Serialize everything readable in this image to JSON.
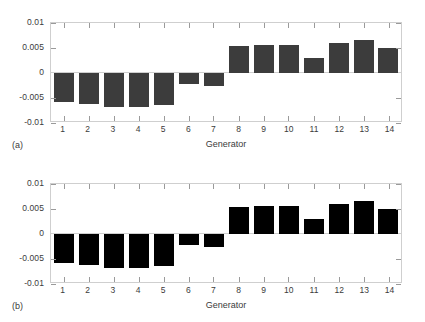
{
  "figure": {
    "background": "#ffffff"
  },
  "panels": [
    {
      "tag": "(a)",
      "bar_color": "#3c3c3c",
      "axis_color": "#cfcfcf",
      "xlabel": "Generator",
      "ylabels": [
        "0.01",
        "0.005",
        "0",
        "-0.005",
        "-0.01"
      ],
      "xticklabels": [
        "1",
        "2",
        "3",
        "4",
        "5",
        "6",
        "7",
        "8",
        "9",
        "10",
        "11",
        "12",
        "13",
        "14"
      ]
    },
    {
      "tag": "(b)",
      "bar_color": "#000000",
      "axis_color": "#cfcfcf",
      "xlabel": "Generator",
      "ylabels": [
        "0.01",
        "0.005",
        "0",
        "-0.005",
        "-0.01"
      ],
      "xticklabels": [
        "1",
        "2",
        "3",
        "4",
        "5",
        "6",
        "7",
        "8",
        "9",
        "10",
        "11",
        "12",
        "13",
        "14"
      ]
    }
  ],
  "chart_data": [
    {
      "type": "bar",
      "title": "(a)",
      "xlabel": "Generator",
      "ylabel": "",
      "categories": [
        "1",
        "2",
        "3",
        "4",
        "5",
        "6",
        "7",
        "8",
        "9",
        "10",
        "11",
        "12",
        "13",
        "14"
      ],
      "values": [
        -0.0057,
        -0.0062,
        -0.0067,
        -0.0067,
        -0.0064,
        -0.0021,
        -0.0025,
        0.0054,
        0.0057,
        0.0057,
        0.003,
        0.0061,
        0.0067,
        0.0051
      ],
      "ylim": [
        -0.01,
        0.01
      ],
      "yticks": [
        0.01,
        0.005,
        0,
        -0.005,
        -0.01
      ],
      "yticklabels": [
        "0.01",
        "0.005",
        "0",
        "-0.005",
        "-0.01"
      ],
      "grid": false,
      "legend": null,
      "bar_color": "#3c3c3c"
    },
    {
      "type": "bar",
      "title": "(b)",
      "xlabel": "Generator",
      "ylabel": "",
      "categories": [
        "1",
        "2",
        "3",
        "4",
        "5",
        "6",
        "7",
        "8",
        "9",
        "10",
        "11",
        "12",
        "13",
        "14"
      ],
      "values": [
        -0.0057,
        -0.0062,
        -0.0067,
        -0.0067,
        -0.0064,
        -0.0021,
        -0.0025,
        0.0054,
        0.0057,
        0.0057,
        0.003,
        0.0061,
        0.0067,
        0.0051
      ],
      "ylim": [
        -0.01,
        0.01
      ],
      "yticks": [
        0.01,
        0.005,
        0,
        -0.005,
        -0.01
      ],
      "yticklabels": [
        "0.01",
        "0.005",
        "0",
        "-0.005",
        "-0.01"
      ],
      "grid": false,
      "legend": null,
      "bar_color": "#000000"
    }
  ]
}
